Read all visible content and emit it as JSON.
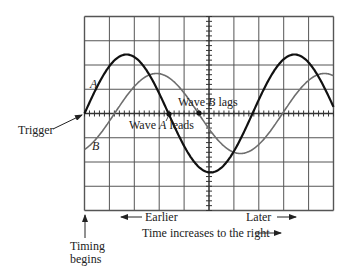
{
  "figure": {
    "type": "oscilloscope-phase-diagram",
    "grid": {
      "columns": 10,
      "rows": 8
    },
    "waves": [
      {
        "name": "A",
        "label": "A",
        "color": "#111111",
        "role": "leads"
      },
      {
        "name": "B",
        "label": "B",
        "color": "#6e6e6e",
        "role": "lags"
      }
    ]
  },
  "labels": {
    "wave_a": "A",
    "wave_b": "B",
    "wave_b_lags_prefix": "Wave ",
    "wave_b_lags_var": "B",
    "wave_b_lags_suffix": " lags",
    "wave_a_leads_prefix": "Wave ",
    "wave_a_leads_var": "A",
    "wave_a_leads_suffix": " leads",
    "trigger": "Trigger",
    "earlier": "Earlier",
    "later": "Later",
    "time_axis": "Time increases to the right",
    "timing_begins_line1": "Timing",
    "timing_begins_line2": "begins"
  }
}
